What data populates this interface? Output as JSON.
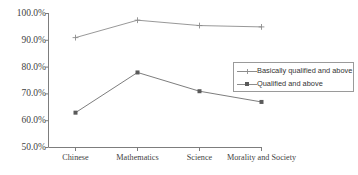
{
  "chart_data": {
    "type": "line",
    "title": "",
    "xlabel": "",
    "ylabel": "",
    "categories": [
      "Chinese",
      "Mathematics",
      "Science",
      "Morality and Society"
    ],
    "series": [
      {
        "name": "Basically qualified and above",
        "values": [
          91.0,
          97.5,
          95.5,
          95.0
        ],
        "marker": "plus",
        "color": "#8c8c8c"
      },
      {
        "name": "Qualified and above",
        "values": [
          63.0,
          78.0,
          71.0,
          67.0
        ],
        "marker": "square",
        "color": "#5a5a5a"
      }
    ],
    "ylim": [
      50.0,
      100.0
    ],
    "ytick_values": [
      50.0,
      60.0,
      70.0,
      80.0,
      90.0,
      100.0
    ],
    "ytick_labels": [
      "50.0%",
      "60.0%",
      "70.0%",
      "80.0%",
      "90.0%",
      "100.0%"
    ],
    "grid": false,
    "legend_position": "right-middle"
  },
  "legend": {
    "entries": [
      {
        "label": "Basically qualified and above"
      },
      {
        "label": "Qualified and above"
      }
    ]
  },
  "axis": {
    "y_labels": [
      "100.0%",
      "90.0%",
      "80.0%",
      "70.0%",
      "60.0%",
      "50.0%"
    ],
    "x_labels": [
      "Chinese",
      "Mathematics",
      "Science",
      "Morality and Society"
    ]
  },
  "colors": {
    "axis": "#7d7d7d",
    "series_1": "#8c8c8c",
    "series_2": "#5a5a5a",
    "legend_border": "#9a9a9a",
    "background": "#ffffff"
  }
}
